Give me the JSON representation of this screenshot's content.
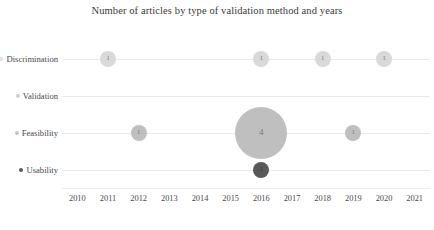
{
  "chart_data": {
    "type": "bubble",
    "title": "Number of articles by type of validation method and years",
    "xlabel": "",
    "ylabel": "",
    "grid": true,
    "legend": "none",
    "x": [
      2010,
      2011,
      2012,
      2013,
      2014,
      2015,
      2016,
      2017,
      2018,
      2019,
      2020,
      2021
    ],
    "xlim": [
      2010,
      2021
    ],
    "categories": [
      "Discrimination",
      "Validation",
      "Feasibility",
      "Usability"
    ],
    "series": [
      {
        "name": "Discrimination",
        "color": "#d9d9d9",
        "points": [
          {
            "x": 2011,
            "value": 1
          },
          {
            "x": 2016,
            "value": 1
          },
          {
            "x": 2018,
            "value": 1
          },
          {
            "x": 2020,
            "value": 1
          }
        ]
      },
      {
        "name": "Validation",
        "color": "#d0d0d0",
        "points": []
      },
      {
        "name": "Feasibility",
        "color": "#bfbfbf",
        "points": [
          {
            "x": 2012,
            "value": 1
          },
          {
            "x": 2016,
            "value": 4
          },
          {
            "x": 2019,
            "value": 1
          }
        ]
      },
      {
        "name": "Usability",
        "color": "#595959",
        "points": [
          {
            "x": 2016,
            "value": 1
          }
        ]
      }
    ]
  },
  "axis": {
    "y_labels": [
      {
        "label": "Discrimination",
        "marker_color": "#e2e2e2"
      },
      {
        "label": "Validation",
        "marker_color": "#cfcfcf"
      },
      {
        "label": "Feasibility",
        "marker_color": "#c4c4c4"
      },
      {
        "label": "Usability",
        "marker_color": "#5a5a5a"
      }
    ],
    "x_labels": [
      "2010",
      "2011",
      "2012",
      "2013",
      "2014",
      "2015",
      "2016",
      "2017",
      "2018",
      "2019",
      "2020",
      "2021"
    ]
  },
  "colors": {
    "gridline": "#e9e9ea",
    "text": "#4a4a4a",
    "title": "#3a3a3a",
    "background": "#ffffff"
  }
}
